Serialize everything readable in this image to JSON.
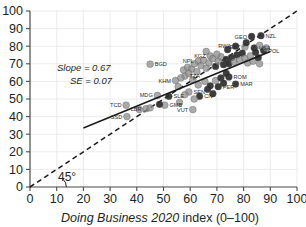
{
  "chart_data": {
    "type": "scatter",
    "title": "",
    "xlabel_italic": "Doing Business 2020",
    "xlabel_rest": " index (0–100)",
    "xlabel": "Doing Business 2020 index (0–100)",
    "ylabel": "",
    "xlim": [
      0,
      100
    ],
    "ylim": [
      0,
      100
    ],
    "xticks": [
      0,
      10,
      20,
      30,
      40,
      50,
      60,
      70,
      80,
      90,
      100
    ],
    "yticks": [
      0,
      10,
      20,
      30,
      40,
      50,
      60,
      70,
      80,
      90,
      100
    ],
    "grid": true,
    "legend": "none",
    "annotations": {
      "slope": "Slope = 0.67",
      "se": "SE = 0.07",
      "angle": "45°"
    },
    "fit_line": {
      "style": "solid",
      "slope": 0.67,
      "se": 0.07,
      "x_start": 20,
      "y_start": 33.5,
      "x_end": 90,
      "y_end": 77.0
    },
    "reference_line": {
      "style": "dashed",
      "label": "45°",
      "x_start": 0,
      "y_start": 0,
      "x_end": 100,
      "y_end": 100
    },
    "colors": {
      "point_light": "#8e8e8e",
      "point_dark": "#2b2b2b",
      "grid": "#e3e3e3",
      "axis": "#4a4a4a",
      "line": "#1a1a1a",
      "text": "#231f20"
    },
    "points": [
      {
        "code": "TCD",
        "x": 36.0,
        "y": 46.5,
        "shade": "light",
        "label_side": "left"
      },
      {
        "code": "SSD",
        "x": 36.3,
        "y": 40.0,
        "shade": "light",
        "label_side": "left"
      },
      {
        "code": "LBR",
        "x": 43.5,
        "y": 44.5,
        "shade": "light",
        "label_side": "left"
      },
      {
        "code": "MDG",
        "x": 47.7,
        "y": 52.0,
        "shade": "light",
        "label_side": "left"
      },
      {
        "code": "SLE",
        "x": 52.0,
        "y": 51.5,
        "shade": "dark",
        "label_side": "right"
      },
      {
        "code": "GMB",
        "x": 50.5,
        "y": 46.5,
        "shade": "light",
        "label_side": "right"
      },
      {
        "code": "BGD",
        "x": 45.0,
        "y": 69.8,
        "shade": "light",
        "label_side": "right"
      },
      {
        "code": "KHM",
        "x": 54.5,
        "y": 60.5,
        "shade": "light",
        "label_side": "left"
      },
      {
        "code": "TZA",
        "x": 58.0,
        "y": 63.0,
        "shade": "light",
        "label_side": "right"
      },
      {
        "code": "NPL",
        "x": 63.0,
        "y": 71.5,
        "shade": "light",
        "label_side": "left"
      },
      {
        "code": "KGZ",
        "x": 67.5,
        "y": 74.5,
        "shade": "light",
        "label_side": "left"
      },
      {
        "code": "SEN",
        "x": 59.5,
        "y": 54.0,
        "shade": "light",
        "label_side": "right"
      },
      {
        "code": "CIV",
        "x": 63.5,
        "y": 51.5,
        "shade": "dark",
        "label_side": "right"
      },
      {
        "code": "VUT",
        "x": 61.0,
        "y": 44.0,
        "shade": "light",
        "label_side": "left"
      },
      {
        "code": "RWA",
        "x": 77.0,
        "y": 80.0,
        "shade": "dark",
        "label_side": "left"
      },
      {
        "code": "GEO",
        "x": 83.0,
        "y": 85.5,
        "shade": "dark",
        "label_side": "left"
      },
      {
        "code": "NZL",
        "x": 86.5,
        "y": 86.0,
        "shade": "dark",
        "label_side": "right"
      },
      {
        "code": "EST",
        "x": 80.5,
        "y": 79.5,
        "shade": "light",
        "label_side": "left"
      },
      {
        "code": "USA",
        "x": 84.0,
        "y": 79.0,
        "shade": "dark",
        "label_side": "right"
      },
      {
        "code": "POL",
        "x": 87.5,
        "y": 77.5,
        "shade": "dark",
        "label_side": "right"
      },
      {
        "code": "ROM",
        "x": 74.5,
        "y": 62.5,
        "shade": "dark",
        "label_side": "right"
      },
      {
        "code": "MAR",
        "x": 77.0,
        "y": 58.5,
        "shade": "dark",
        "label_side": "right"
      },
      {
        "code": "PER",
        "x": 70.5,
        "y": 57.0,
        "shade": "dark",
        "label_side": "right"
      },
      {
        "code": "",
        "x": 56.5,
        "y": 62.0,
        "shade": "light",
        "label_side": "none"
      },
      {
        "code": "",
        "x": 57.5,
        "y": 66.5,
        "shade": "light",
        "label_side": "none"
      },
      {
        "code": "",
        "x": 59.0,
        "y": 68.0,
        "shade": "light",
        "label_side": "none"
      },
      {
        "code": "",
        "x": 60.5,
        "y": 67.0,
        "shade": "light",
        "label_side": "none"
      },
      {
        "code": "",
        "x": 61.5,
        "y": 70.0,
        "shade": "light",
        "label_side": "none"
      },
      {
        "code": "",
        "x": 62.5,
        "y": 65.5,
        "shade": "light",
        "label_side": "none"
      },
      {
        "code": "",
        "x": 64.0,
        "y": 69.0,
        "shade": "light",
        "label_side": "none"
      },
      {
        "code": "",
        "x": 65.0,
        "y": 72.0,
        "shade": "light",
        "label_side": "none"
      },
      {
        "code": "",
        "x": 66.0,
        "y": 67.5,
        "shade": "light",
        "label_side": "none"
      },
      {
        "code": "",
        "x": 67.0,
        "y": 70.5,
        "shade": "light",
        "label_side": "none"
      },
      {
        "code": "",
        "x": 68.5,
        "y": 73.0,
        "shade": "light",
        "label_side": "none"
      },
      {
        "code": "",
        "x": 69.5,
        "y": 68.5,
        "shade": "dark",
        "label_side": "none"
      },
      {
        "code": "",
        "x": 70.5,
        "y": 71.5,
        "shade": "light",
        "label_side": "none"
      },
      {
        "code": "",
        "x": 71.5,
        "y": 74.0,
        "shade": "light",
        "label_side": "none"
      },
      {
        "code": "",
        "x": 72.5,
        "y": 69.5,
        "shade": "dark",
        "label_side": "none"
      },
      {
        "code": "",
        "x": 73.5,
        "y": 72.5,
        "shade": "dark",
        "label_side": "none"
      },
      {
        "code": "",
        "x": 74.5,
        "y": 70.0,
        "shade": "dark",
        "label_side": "none"
      },
      {
        "code": "",
        "x": 75.5,
        "y": 73.5,
        "shade": "dark",
        "label_side": "none"
      },
      {
        "code": "",
        "x": 76.5,
        "y": 71.0,
        "shade": "light",
        "label_side": "none"
      },
      {
        "code": "",
        "x": 77.5,
        "y": 75.0,
        "shade": "dark",
        "label_side": "none"
      },
      {
        "code": "",
        "x": 78.5,
        "y": 72.0,
        "shade": "light",
        "label_side": "none"
      },
      {
        "code": "",
        "x": 79.5,
        "y": 76.0,
        "shade": "dark",
        "label_side": "none"
      },
      {
        "code": "",
        "x": 80.5,
        "y": 73.0,
        "shade": "light",
        "label_side": "none"
      },
      {
        "code": "",
        "x": 81.5,
        "y": 70.5,
        "shade": "light",
        "label_side": "none"
      },
      {
        "code": "",
        "x": 82.5,
        "y": 74.5,
        "shade": "light",
        "label_side": "none"
      },
      {
        "code": "",
        "x": 83.5,
        "y": 71.5,
        "shade": "light",
        "label_side": "none"
      },
      {
        "code": "",
        "x": 84.5,
        "y": 76.5,
        "shade": "dark",
        "label_side": "none"
      },
      {
        "code": "",
        "x": 85.5,
        "y": 73.5,
        "shade": "dark",
        "label_side": "none"
      },
      {
        "code": "",
        "x": 86.0,
        "y": 70.0,
        "shade": "light",
        "label_side": "none"
      },
      {
        "code": "",
        "x": 63.0,
        "y": 58.0,
        "shade": "light",
        "label_side": "none"
      },
      {
        "code": "",
        "x": 65.5,
        "y": 60.0,
        "shade": "light",
        "label_side": "none"
      },
      {
        "code": "",
        "x": 66.5,
        "y": 55.5,
        "shade": "dark",
        "label_side": "none"
      },
      {
        "code": "",
        "x": 67.5,
        "y": 57.5,
        "shade": "dark",
        "label_side": "none"
      },
      {
        "code": "",
        "x": 68.5,
        "y": 53.0,
        "shade": "dark",
        "label_side": "none"
      },
      {
        "code": "",
        "x": 69.5,
        "y": 60.5,
        "shade": "light",
        "label_side": "none"
      },
      {
        "code": "",
        "x": 71.5,
        "y": 62.0,
        "shade": "dark",
        "label_side": "none"
      },
      {
        "code": "",
        "x": 72.5,
        "y": 59.0,
        "shade": "dark",
        "label_side": "none"
      },
      {
        "code": "",
        "x": 73.5,
        "y": 64.5,
        "shade": "dark",
        "label_side": "none"
      },
      {
        "code": "",
        "x": 59.5,
        "y": 64.5,
        "shade": "light",
        "label_side": "none"
      },
      {
        "code": "",
        "x": 61.0,
        "y": 61.0,
        "shade": "light",
        "label_side": "none"
      },
      {
        "code": "",
        "x": 55.5,
        "y": 57.0,
        "shade": "light",
        "label_side": "none"
      },
      {
        "code": "",
        "x": 58.0,
        "y": 52.5,
        "shade": "light",
        "label_side": "none"
      },
      {
        "code": "",
        "x": 61.5,
        "y": 50.0,
        "shade": "light",
        "label_side": "none"
      },
      {
        "code": "",
        "x": 56.0,
        "y": 48.0,
        "shade": "light",
        "label_side": "none"
      },
      {
        "code": "",
        "x": 48.5,
        "y": 47.0,
        "shade": "dark",
        "label_side": "none"
      },
      {
        "code": "",
        "x": 45.0,
        "y": 45.0,
        "shade": "light",
        "label_side": "none"
      },
      {
        "code": "",
        "x": 41.0,
        "y": 44.0,
        "shade": "light",
        "label_side": "none"
      },
      {
        "code": "",
        "x": 66.0,
        "y": 77.0,
        "shade": "light",
        "label_side": "none"
      },
      {
        "code": "",
        "x": 70.0,
        "y": 75.5,
        "shade": "light",
        "label_side": "none"
      },
      {
        "code": "",
        "x": 74.0,
        "y": 78.0,
        "shade": "dark",
        "label_side": "none"
      },
      {
        "code": "",
        "x": 81.0,
        "y": 82.0,
        "shade": "dark",
        "label_side": "none"
      },
      {
        "code": "",
        "x": 86.0,
        "y": 80.5,
        "shade": "light",
        "label_side": "none"
      },
      {
        "code": "",
        "x": 88.5,
        "y": 79.0,
        "shade": "light",
        "label_side": "none"
      }
    ]
  }
}
